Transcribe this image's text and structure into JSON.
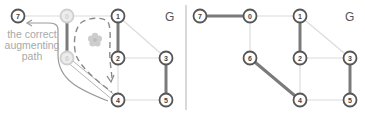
{
  "left_panel": {
    "title": "G",
    "annotation": [
      "the correct",
      "augmenting",
      "path"
    ],
    "nodes": [
      {
        "id": "7",
        "label": "7",
        "x": 18,
        "y": 16,
        "faded": false
      },
      {
        "id": "0",
        "label": "0",
        "x": 67,
        "y": 16,
        "faded": true
      },
      {
        "id": "1",
        "label": "1",
        "x": 118,
        "y": 16,
        "faded": false
      },
      {
        "id": "6",
        "label": "6",
        "x": 67,
        "y": 58,
        "faded": true
      },
      {
        "id": "2",
        "label": "2",
        "x": 118,
        "y": 58,
        "faded": false
      },
      {
        "id": "3",
        "label": "3",
        "x": 166,
        "y": 58,
        "faded": false
      },
      {
        "id": "4",
        "label": "4",
        "x": 118,
        "y": 100,
        "faded": false
      },
      {
        "id": "5",
        "label": "5",
        "x": 166,
        "y": 100,
        "faded": false
      }
    ],
    "matched_edges": [
      [
        "0",
        "6"
      ],
      [
        "1",
        "2"
      ],
      [
        "3",
        "5"
      ]
    ],
    "unmatched_edges": [
      [
        "7",
        "0"
      ],
      [
        "0",
        "1"
      ],
      [
        "1",
        "3"
      ],
      [
        "2",
        "3"
      ],
      [
        "2",
        "4"
      ],
      [
        "4",
        "5"
      ],
      [
        "6",
        "4"
      ]
    ],
    "blossom_icon": "flower-icon",
    "colors": {
      "matched": "#808080",
      "unmatched": "#d9d9d9",
      "node_stroke": "#555555",
      "faded_node": "#cfcfcf",
      "annotation": "#a9a9a9"
    }
  },
  "right_panel": {
    "title": "G",
    "nodes": [
      {
        "id": "7",
        "label": "7",
        "x": 200,
        "y": 16
      },
      {
        "id": "0",
        "label": "0",
        "x": 250,
        "y": 16
      },
      {
        "id": "1",
        "label": "1",
        "x": 300,
        "y": 16
      },
      {
        "id": "6",
        "label": "6",
        "x": 250,
        "y": 58
      },
      {
        "id": "2",
        "label": "2",
        "x": 300,
        "y": 58
      },
      {
        "id": "3",
        "label": "3",
        "x": 350,
        "y": 58
      },
      {
        "id": "4",
        "label": "4",
        "x": 300,
        "y": 100
      },
      {
        "id": "5",
        "label": "5",
        "x": 350,
        "y": 100
      }
    ],
    "matched_edges": [
      [
        "7",
        "0"
      ],
      [
        "1",
        "2"
      ],
      [
        "6",
        "4"
      ],
      [
        "3",
        "5"
      ]
    ],
    "unmatched_edges": [
      [
        "0",
        "1"
      ],
      [
        "0",
        "6"
      ],
      [
        "1",
        "3"
      ],
      [
        "2",
        "3"
      ],
      [
        "2",
        "4"
      ],
      [
        "4",
        "5"
      ]
    ]
  }
}
